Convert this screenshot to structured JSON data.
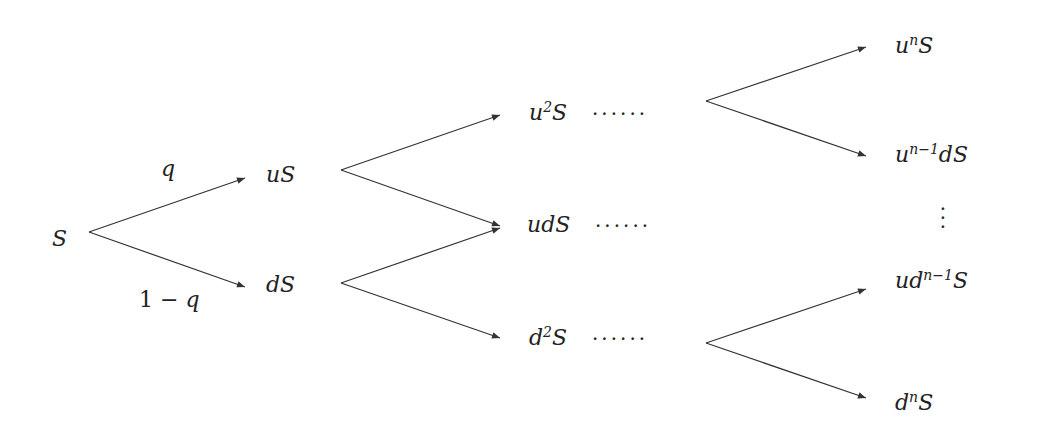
{
  "diagram": {
    "colors": {
      "line": "#333333",
      "text": "#222222",
      "background": "#ffffff"
    },
    "root": {
      "label": "S"
    },
    "edge_labels": {
      "up_prob": "q",
      "down_prob_a": "1",
      "down_prob_op": "−",
      "down_prob_b": "q"
    },
    "level1": [
      {
        "base": "u",
        "tail": "S"
      },
      {
        "base": "d",
        "tail": "S"
      }
    ],
    "level2": [
      {
        "base": "u",
        "sup": "2",
        "tail": "S",
        "dots": "······"
      },
      {
        "base": "ud",
        "sup": "",
        "tail": "S",
        "dots": "······"
      },
      {
        "base": "d",
        "sup": "2",
        "tail": "S",
        "dots": "······"
      }
    ],
    "leaves": [
      {
        "pre": "u",
        "sup": "n",
        "post": "S"
      },
      {
        "pre": "u",
        "sup": "n−1",
        "post": "dS"
      },
      {
        "pre": "ud",
        "sup": "n−1",
        "post": "S"
      },
      {
        "pre": "d",
        "sup": "n",
        "post": "S"
      }
    ],
    "vertical_ellipsis": ".\n.\n."
  }
}
